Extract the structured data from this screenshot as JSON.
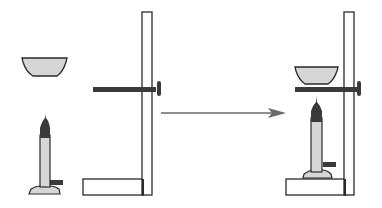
{
  "diagram": {
    "colors": {
      "background": "#ffffff",
      "outline": "#2a2a2a",
      "fill_light": "#d6d6d6",
      "fill_dark": "#3a3a3a",
      "arrow": "#6a6a6a"
    },
    "panels": [
      {
        "name": "before",
        "components": [
          "evaporating-dish",
          "bunsen-burner",
          "retort-stand",
          "clamp-rod"
        ]
      },
      {
        "name": "after",
        "components": [
          "evaporating-dish-on-clamp",
          "bunsen-burner-on-base",
          "retort-stand",
          "clamp-rod"
        ]
      }
    ],
    "arrow": {
      "direction": "right",
      "meaning": "assemble"
    }
  }
}
